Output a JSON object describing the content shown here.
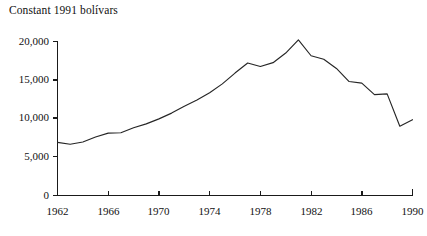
{
  "chart_data": {
    "type": "line",
    "title": "Constant 1991 bolívars",
    "subtitle": "",
    "xlabel": "",
    "ylabel": "",
    "xlim": [
      1962,
      1990
    ],
    "ylim": [
      0,
      20000
    ],
    "grid": false,
    "legend": false,
    "legend_position": "none",
    "x_tick_labels": [
      "1962",
      "1966",
      "1970",
      "1974",
      "1978",
      "1982",
      "1986",
      "1990"
    ],
    "x_ticks": [
      1962,
      1966,
      1970,
      1974,
      1978,
      1982,
      1986,
      1990
    ],
    "y_tick_labels": [
      "0",
      "5,000",
      "10,000",
      "15,000",
      "20,000"
    ],
    "y_ticks": [
      0,
      5000,
      10000,
      15000,
      20000
    ],
    "x": [
      1962,
      1963,
      1964,
      1965,
      1966,
      1967,
      1968,
      1969,
      1970,
      1971,
      1972,
      1973,
      1974,
      1975,
      1976,
      1977,
      1978,
      1979,
      1980,
      1981,
      1982,
      1983,
      1984,
      1985,
      1986,
      1987,
      1988,
      1989,
      1990
    ],
    "values": [
      6900,
      6650,
      6950,
      7600,
      8100,
      8150,
      8800,
      9300,
      9950,
      10700,
      11600,
      12400,
      13350,
      14500,
      15900,
      17200,
      16750,
      17250,
      18500,
      20200,
      18150,
      17700,
      16500,
      14800,
      14600,
      13100,
      13200,
      9000,
      9850
    ],
    "series": [
      {
        "name": "Constant 1991 bolívars",
        "color": "#262626",
        "values": [
          6900,
          6650,
          6950,
          7600,
          8100,
          8150,
          8800,
          9300,
          9950,
          10700,
          11600,
          12400,
          13350,
          14500,
          15900,
          17200,
          16750,
          17250,
          18500,
          20200,
          18150,
          17700,
          16500,
          14800,
          14600,
          13100,
          13200,
          9000,
          9850
        ]
      }
    ],
    "annotations": []
  },
  "axes": {
    "y_labels": [
      "20,000",
      "15,000",
      "10,000",
      "5,000",
      "0"
    ],
    "x_labels": [
      "1962",
      "1966",
      "1970",
      "1974",
      "1978",
      "1982",
      "1986",
      "1990"
    ]
  }
}
